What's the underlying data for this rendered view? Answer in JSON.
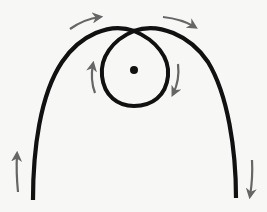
{
  "diagram": {
    "title": "",
    "colors": {
      "background": "#f7f7f5",
      "curve": "#111111",
      "arrow": "#666666",
      "point": "#111111"
    },
    "elements": {
      "outer_curve": "outer-curve",
      "loop": "loop",
      "center_point": "center-point",
      "arrows": [
        {
          "name": "arrow-top-left",
          "direction": "right"
        },
        {
          "name": "arrow-top-right",
          "direction": "right-down"
        },
        {
          "name": "arrow-loop-left",
          "direction": "up"
        },
        {
          "name": "arrow-loop-right",
          "direction": "down"
        },
        {
          "name": "arrow-bottom-left",
          "direction": "up"
        },
        {
          "name": "arrow-bottom-right",
          "direction": "down"
        }
      ]
    }
  }
}
